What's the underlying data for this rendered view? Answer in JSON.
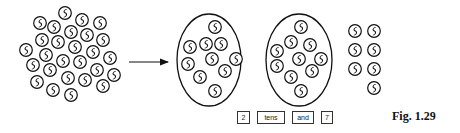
{
  "figure": {
    "caption": "Fig. 1.29",
    "total_coins": 27,
    "coin_icon": "rupee-coin-icon",
    "colors": {
      "ink": "#111111",
      "background": "#ffffff"
    }
  },
  "loose_cluster": {
    "coins": [
      [
        65,
        13
      ],
      [
        40,
        23
      ],
      [
        54,
        27
      ],
      [
        82,
        20
      ],
      [
        100,
        23
      ],
      [
        71,
        32
      ],
      [
        42,
        40
      ],
      [
        58,
        42
      ],
      [
        87,
        35
      ],
      [
        103,
        40
      ],
      [
        26,
        50
      ],
      [
        46,
        55
      ],
      [
        75,
        47
      ],
      [
        93,
        52
      ],
      [
        110,
        58
      ],
      [
        33,
        65
      ],
      [
        63,
        61
      ],
      [
        80,
        62
      ],
      [
        50,
        70
      ],
      [
        97,
        70
      ],
      [
        114,
        75
      ],
      [
        37,
        82
      ],
      [
        68,
        78
      ],
      [
        85,
        80
      ],
      [
        103,
        86
      ],
      [
        53,
        90
      ],
      [
        71,
        95
      ]
    ]
  },
  "arrow": {
    "x1": 129,
    "y1": 62,
    "x2": 168,
    "y2": 62
  },
  "groups": [
    {
      "cx": 209,
      "cy": 60,
      "rx": 32,
      "ry": 46,
      "coins": [
        [
          215,
          27
        ],
        [
          190,
          47
        ],
        [
          206,
          44
        ],
        [
          221,
          44
        ],
        [
          188,
          64
        ],
        [
          212,
          59
        ],
        [
          236,
          59
        ],
        [
          200,
          77
        ],
        [
          225,
          71
        ],
        [
          215,
          91
        ]
      ]
    },
    {
      "cx": 299,
      "cy": 60,
      "rx": 33,
      "ry": 46,
      "coins": [
        [
          301,
          27
        ],
        [
          277,
          51
        ],
        [
          291,
          42
        ],
        [
          310,
          45
        ],
        [
          277,
          66
        ],
        [
          299,
          59
        ],
        [
          321,
          59
        ],
        [
          291,
          77
        ],
        [
          312,
          71
        ],
        [
          301,
          91
        ]
      ]
    }
  ],
  "ones": {
    "coins": [
      [
        355,
        31
      ],
      [
        374,
        31
      ],
      [
        355,
        50
      ],
      [
        374,
        50
      ],
      [
        355,
        69
      ],
      [
        374,
        69
      ],
      [
        374,
        88
      ]
    ]
  },
  "answer_boxes": [
    {
      "label": "2",
      "x": 237,
      "w": 13
    },
    {
      "label": "tens",
      "x": 257,
      "w": 28
    },
    {
      "label": "and",
      "x": 292,
      "w": 22
    },
    {
      "label": "7",
      "x": 321,
      "w": 12
    }
  ]
}
